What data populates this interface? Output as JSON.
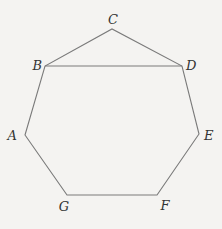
{
  "diagram": {
    "type": "polygon-figure",
    "colors": {
      "background": "#f4f3f1",
      "stroke": "#7a7a7a",
      "label": "#333333"
    },
    "vertices": [
      {
        "id": "A",
        "label": "A",
        "x": 25,
        "y": 135,
        "lx": 17,
        "ly": 140,
        "anchor": "end"
      },
      {
        "id": "B",
        "label": "B",
        "x": 45,
        "y": 66,
        "lx": 42,
        "ly": 70,
        "anchor": "end"
      },
      {
        "id": "C",
        "label": "C",
        "x": 112,
        "y": 29,
        "lx": 113,
        "ly": 24,
        "anchor": "middle"
      },
      {
        "id": "D",
        "label": "D",
        "x": 182,
        "y": 66,
        "lx": 186,
        "ly": 70,
        "anchor": "start"
      },
      {
        "id": "E",
        "label": "E",
        "x": 199,
        "y": 134,
        "lx": 204,
        "ly": 140,
        "anchor": "start"
      },
      {
        "id": "F",
        "label": "F",
        "x": 157,
        "y": 195,
        "lx": 165,
        "ly": 210,
        "anchor": "middle"
      },
      {
        "id": "G",
        "label": "G",
        "x": 67,
        "y": 195,
        "lx": 64,
        "ly": 211,
        "anchor": "middle"
      }
    ],
    "polygon_order": [
      "A",
      "B",
      "C",
      "D",
      "E",
      "F",
      "G"
    ],
    "extra_segments": [
      [
        "B",
        "D"
      ]
    ]
  }
}
